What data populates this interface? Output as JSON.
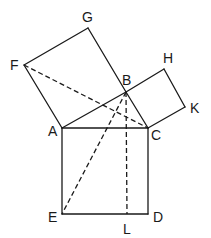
{
  "diagram": {
    "points": {
      "F": {
        "label": "F",
        "x": 24,
        "y": 65
      },
      "G": {
        "label": "G",
        "x": 88,
        "y": 28
      },
      "B": {
        "label": "B",
        "x": 126,
        "y": 92
      },
      "H": {
        "label": "H",
        "x": 164,
        "y": 69
      },
      "K": {
        "label": "K",
        "x": 185,
        "y": 107
      },
      "A": {
        "label": "A",
        "x": 62,
        "y": 128
      },
      "C": {
        "label": "C",
        "x": 148,
        "y": 128
      },
      "E": {
        "label": "E",
        "x": 62,
        "y": 214
      },
      "D": {
        "label": "D",
        "x": 148,
        "y": 214
      },
      "L": {
        "label": "L",
        "x": 127,
        "y": 214
      }
    },
    "solid_segments": [
      [
        "F",
        "G"
      ],
      [
        "G",
        "B"
      ],
      [
        "A",
        "F"
      ],
      [
        "A",
        "B"
      ],
      [
        "B",
        "H"
      ],
      [
        "H",
        "K"
      ],
      [
        "K",
        "C"
      ],
      [
        "B",
        "C"
      ],
      [
        "A",
        "C"
      ],
      [
        "A",
        "E"
      ],
      [
        "E",
        "D"
      ],
      [
        "C",
        "D"
      ]
    ],
    "dashed_segments": [
      [
        "F",
        "C"
      ],
      [
        "B",
        "E"
      ],
      [
        "B",
        "L"
      ]
    ],
    "labels": {
      "F": {
        "text": "F",
        "x": 10,
        "y": 70
      },
      "G": {
        "text": "G",
        "x": 82,
        "y": 22
      },
      "B": {
        "text": "B",
        "x": 122,
        "y": 85
      },
      "H": {
        "text": "H",
        "x": 163,
        "y": 63
      },
      "K": {
        "text": "K",
        "x": 190,
        "y": 113
      },
      "A": {
        "text": "A",
        "x": 48,
        "y": 136
      },
      "C": {
        "text": "C",
        "x": 151,
        "y": 140
      },
      "E": {
        "text": "E",
        "x": 48,
        "y": 222
      },
      "D": {
        "text": "D",
        "x": 153,
        "y": 222
      },
      "L": {
        "text": "L",
        "x": 123,
        "y": 234
      }
    }
  }
}
